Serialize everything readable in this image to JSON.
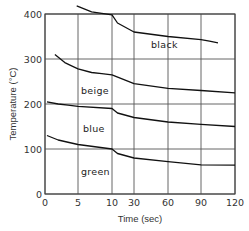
{
  "chart_data": {
    "type": "line",
    "title": "",
    "xlabel": "Time (sec)",
    "ylabel": "Temperature (°C)",
    "x_ticks": [
      0,
      5,
      10,
      30,
      60,
      90,
      120
    ],
    "x_tick_labels": [
      "0",
      "5",
      "10",
      "30",
      "60",
      "90",
      "120"
    ],
    "x_axis_note": "segmented axis: 0–10 s linear, 10–120 s compressed scale",
    "y_ticks": [
      0,
      100,
      200,
      300,
      400
    ],
    "y_tick_labels": [
      "0",
      "100",
      "200",
      "300",
      "400"
    ],
    "ylim": [
      0,
      400
    ],
    "xlim": [
      0,
      120
    ],
    "grid": true,
    "legend": "inline labels",
    "series": [
      {
        "name": "black",
        "x": [
          4.8,
          7,
          10,
          15,
          30,
          60,
          90,
          105
        ],
        "values": [
          418,
          405,
          398,
          380,
          360,
          350,
          343,
          336
        ]
      },
      {
        "name": "beige",
        "x": [
          1.5,
          3,
          5,
          7,
          10,
          30,
          60,
          90,
          120
        ],
        "values": [
          310,
          292,
          278,
          270,
          265,
          245,
          235,
          230,
          225
        ]
      },
      {
        "name": "blue",
        "x": [
          0.3,
          2,
          5,
          10,
          15,
          30,
          60,
          90,
          120
        ],
        "values": [
          205,
          200,
          195,
          190,
          180,
          170,
          160,
          155,
          150
        ]
      },
      {
        "name": "green",
        "x": [
          0.3,
          2,
          5,
          10,
          15,
          30,
          60,
          90,
          120
        ],
        "values": [
          130,
          120,
          110,
          100,
          90,
          80,
          72,
          65,
          64
        ]
      }
    ],
    "annotations": [
      {
        "text": "black",
        "x": 60,
        "y": 365
      },
      {
        "text": "beige",
        "x": 5,
        "y": 235
      },
      {
        "text": "blue",
        "x": 5,
        "y": 160
      },
      {
        "text": "green",
        "x": 5,
        "y": 55
      }
    ]
  },
  "labels": {
    "xlabel": "Time (sec)",
    "ylabel": "Temperature (°C)",
    "black": "black",
    "beige": "beige",
    "blue": "blue",
    "green": "green"
  }
}
